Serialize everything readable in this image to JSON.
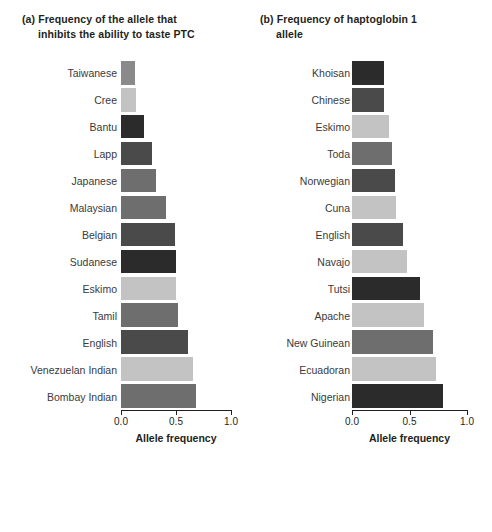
{
  "chart_data": [
    {
      "type": "bar",
      "orientation": "horizontal",
      "panel": "(a)",
      "title": "(a) Frequency of the allele that inhibits the ability to taste PTC",
      "title_line1": "(a) Frequency of the allele that",
      "title_line2": "inhibits the ability to taste PTC",
      "xlabel": "Allele frequency",
      "ylabel": "",
      "xlim": [
        0.0,
        1.0
      ],
      "xticks": [
        0.0,
        0.5,
        1.0
      ],
      "xticklabels": [
        "0.0",
        "0.5",
        "1.0"
      ],
      "grid": false,
      "categories": [
        "Taiwanese",
        "Cree",
        "Bantu",
        "Lapp",
        "Japanese",
        "Malaysian",
        "Belgian",
        "Sudanese",
        "Eskimo",
        "Tamil",
        "English",
        "Venezuelan Indian",
        "Bombay Indian"
      ],
      "values": [
        0.13,
        0.14,
        0.21,
        0.28,
        0.32,
        0.41,
        0.49,
        0.5,
        0.5,
        0.52,
        0.61,
        0.65,
        0.68
      ],
      "point_groups": [
        "Asian",
        "Native American",
        "Black",
        "White",
        "Pacific Islander",
        "Pacific Islander",
        "White",
        "Black",
        "Native American",
        "Pacific Islander",
        "White",
        "Native American",
        "Pacific Islander"
      ]
    },
    {
      "type": "bar",
      "orientation": "horizontal",
      "panel": "(b)",
      "title": "(b) Frequency of haptoglobin 1 allele",
      "title_line1": "(b) Frequency of haptoglobin 1",
      "title_line2": "allele",
      "xlabel": "Allele frequency",
      "ylabel": "",
      "xlim": [
        0.0,
        1.0
      ],
      "xticks": [
        0.0,
        0.5,
        1.0
      ],
      "xticklabels": [
        "0.0",
        "0.5",
        "1.0"
      ],
      "grid": false,
      "categories": [
        "Khoisan",
        "Chinese",
        "Eskimo",
        "Toda",
        "Norwegian",
        "Cuna",
        "English",
        "Navajo",
        "Tutsi",
        "Apache",
        "New Guinean",
        "Ecuadoran",
        "Nigerian"
      ],
      "values": [
        0.28,
        0.28,
        0.32,
        0.35,
        0.37,
        0.38,
        0.44,
        0.48,
        0.59,
        0.63,
        0.7,
        0.73,
        0.79
      ],
      "point_groups": [
        "Black",
        "White",
        "Native American",
        "Pacific Islander",
        "White",
        "Native American",
        "White",
        "Native American",
        "Black",
        "Native American",
        "Pacific Islander",
        "Native American",
        "Black"
      ]
    }
  ],
  "legend": {
    "title": "Race category of population:",
    "items": [
      {
        "label": "Black",
        "color": "#2b2b2b"
      },
      {
        "label": "Asian",
        "color": "#8a8a8a"
      },
      {
        "label": "Pacific Islander",
        "color": "#6e6e6e"
      },
      {
        "label": "White",
        "color": "#4a4a4a"
      },
      {
        "label": "Native American",
        "color": "#c3c3c3"
      }
    ]
  },
  "colors": {
    "Black": "#2b2b2b",
    "White": "#4a4a4a",
    "Pacific Islander": "#6e6e6e",
    "Asian": "#8a8a8a",
    "Native American": "#c3c3c3",
    "axis": "#231f20",
    "background": "#ffffff"
  }
}
